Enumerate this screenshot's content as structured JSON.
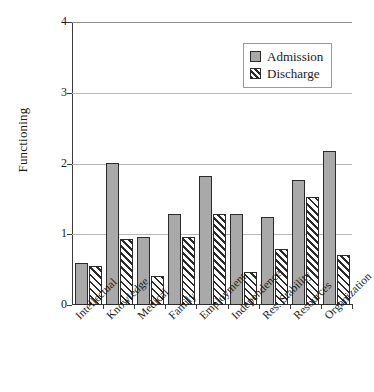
{
  "chart_data": {
    "type": "bar",
    "title": "",
    "xlabel": "",
    "ylabel": "Functioning",
    "ylim": [
      0,
      4
    ],
    "yticks": [
      "0",
      "1",
      "2",
      "3",
      "4"
    ],
    "grid": true,
    "legend_position": "top-right",
    "categories": [
      "Intellectual",
      "Knowledge",
      "Medical",
      "Family",
      "Employment",
      "Independence",
      "Res. Stability",
      "Resources",
      "Organization"
    ],
    "series": [
      {
        "name": "Admission",
        "color": "#a9a9a9",
        "pattern": "solid",
        "values": [
          0.6,
          2.01,
          0.96,
          1.29,
          1.82,
          1.28,
          1.24,
          1.77,
          2.18
        ]
      },
      {
        "name": "Discharge",
        "color": "#ffffff",
        "pattern": "diagonal-hatch",
        "values": [
          0.55,
          0.93,
          0.41,
          0.96,
          1.28,
          0.47,
          0.79,
          1.52,
          0.7
        ]
      }
    ]
  },
  "legend": {
    "entries": [
      {
        "label": "Admission",
        "swatch": "solid-gray-swatch"
      },
      {
        "label": "Discharge",
        "swatch": "hatched-swatch"
      }
    ]
  },
  "axis": {
    "y_title": "Functioning"
  }
}
